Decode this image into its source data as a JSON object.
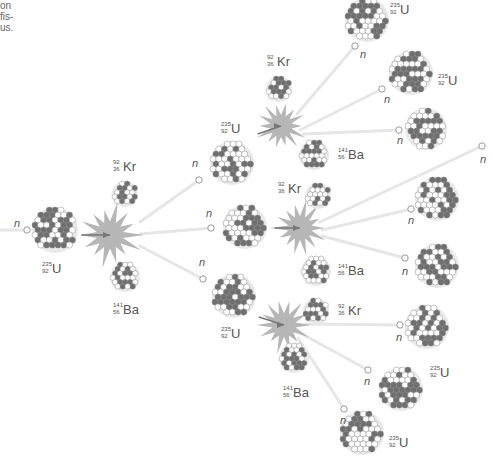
{
  "caption": {
    "lines": [
      "on",
      "fis-",
      "us."
    ]
  },
  "colors": {
    "nucleon_dark": "#6f6f6f",
    "nucleon_light": "#ffffff",
    "nucleon_stroke": "#8a8a8a",
    "burst": "#a9a9a9",
    "trail": "#e6e6e6",
    "neutron_stroke": "#9a9a9a",
    "text": "#555555"
  },
  "labels": {
    "neutron": "n",
    "uranium": {
      "symbol": "U",
      "mass": "235",
      "atomic": "92"
    },
    "krypton": {
      "symbol": "Kr",
      "mass": "92",
      "atomic": "36"
    },
    "barium": {
      "symbol": "Ba",
      "mass": "141",
      "atomic": "56"
    }
  },
  "nuclei": [
    {
      "id": "u-gen0",
      "type": "uranium",
      "cx": 55,
      "cy": 230,
      "r": 23,
      "label_x": 42,
      "label_y": 262
    },
    {
      "id": "kr-gen1",
      "type": "krypton",
      "cx": 125,
      "cy": 194,
      "r": 13,
      "label_x": 113,
      "label_y": 160
    },
    {
      "id": "ba-gen1",
      "type": "barium",
      "cx": 125,
      "cy": 277,
      "r": 15,
      "label_x": 113,
      "label_y": 303
    },
    {
      "id": "u-gen1-top",
      "type": "uranium",
      "cx": 232,
      "cy": 163,
      "r": 22,
      "label_x": 221,
      "label_y": 122
    },
    {
      "id": "u-gen1-mid",
      "type": "uranium",
      "cx": 245,
      "cy": 227,
      "r": 22,
      "label_x": 0,
      "label_y": 0,
      "hide_label": true
    },
    {
      "id": "u-gen1-bot",
      "type": "uranium",
      "cx": 234,
      "cy": 296,
      "r": 22,
      "label_x": 221,
      "label_y": 327
    },
    {
      "id": "kr-gen2a",
      "type": "krypton",
      "cx": 279,
      "cy": 89,
      "r": 13,
      "label_x": 267,
      "label_y": 55
    },
    {
      "id": "ba-gen2a",
      "type": "barium",
      "cx": 314,
      "cy": 155,
      "r": 15,
      "label_x": 338,
      "label_y": 148
    },
    {
      "id": "kr-gen2b",
      "type": "krypton",
      "cx": 318,
      "cy": 196,
      "r": 13,
      "label_x": 278,
      "label_y": 182
    },
    {
      "id": "ba-gen2b",
      "type": "barium",
      "cx": 316,
      "cy": 271,
      "r": 15,
      "label_x": 338,
      "label_y": 264
    },
    {
      "id": "kr-gen2c",
      "type": "krypton",
      "cx": 316,
      "cy": 311,
      "r": 13,
      "label_x": 338,
      "label_y": 304
    },
    {
      "id": "ba-gen2c",
      "type": "barium",
      "cx": 294,
      "cy": 358,
      "r": 15,
      "label_x": 283,
      "label_y": 386
    },
    {
      "id": "u-gen2-1",
      "type": "uranium",
      "cx": 367,
      "cy": 20,
      "r": 22,
      "label_x": 390,
      "label_y": 3
    },
    {
      "id": "u-gen2-2",
      "type": "uranium",
      "cx": 411,
      "cy": 73,
      "r": 22,
      "label_x": 438,
      "label_y": 74
    },
    {
      "id": "u-gen2-3",
      "type": "uranium",
      "cx": 426,
      "cy": 129,
      "r": 21,
      "label_x": 0,
      "label_y": 0,
      "hide_label": true
    },
    {
      "id": "u-gen2-4",
      "type": "uranium",
      "cx": 437,
      "cy": 199,
      "r": 22,
      "label_x": 0,
      "label_y": 0,
      "hide_label": true
    },
    {
      "id": "u-gen2-5",
      "type": "uranium",
      "cx": 437,
      "cy": 266,
      "r": 22,
      "label_x": 0,
      "label_y": 0,
      "hide_label": true
    },
    {
      "id": "u-gen2-6",
      "type": "uranium",
      "cx": 427,
      "cy": 327,
      "r": 22,
      "label_x": 0,
      "label_y": 0,
      "hide_label": true
    },
    {
      "id": "u-gen2-7",
      "type": "uranium",
      "cx": 401,
      "cy": 389,
      "r": 22,
      "label_x": 430,
      "label_y": 366
    },
    {
      "id": "u-gen2-8",
      "type": "uranium",
      "cx": 362,
      "cy": 433,
      "r": 22,
      "label_x": 389,
      "label_y": 436
    }
  ],
  "bursts": [
    {
      "id": "burst-gen1",
      "cx": 110,
      "cy": 235,
      "r": 32
    },
    {
      "id": "burst-gen2-top",
      "cx": 281,
      "cy": 126,
      "r": 26
    },
    {
      "id": "burst-gen2-mid",
      "cx": 300,
      "cy": 228,
      "r": 28
    },
    {
      "id": "burst-gen2-bot",
      "cx": 284,
      "cy": 325,
      "r": 28
    }
  ],
  "neutrons": [
    {
      "id": "n-0",
      "cx": 27,
      "cy": 230,
      "lx": 14,
      "ly": 217,
      "from_x": 0,
      "from_y": 230
    },
    {
      "id": "n-1a",
      "cx": 199,
      "cy": 180,
      "lx": 192,
      "ly": 157,
      "from_x": 140,
      "from_y": 222
    },
    {
      "id": "n-1b",
      "cx": 211,
      "cy": 228,
      "lx": 206,
      "ly": 207,
      "from_x": 140,
      "from_y": 234
    },
    {
      "id": "n-1c",
      "cx": 203,
      "cy": 279,
      "lx": 199,
      "ly": 256,
      "from_x": 140,
      "from_y": 246
    },
    {
      "id": "n-2a",
      "cx": 355,
      "cy": 46,
      "lx": 360,
      "ly": 48,
      "from_x": 297,
      "from_y": 114
    },
    {
      "id": "n-2b",
      "cx": 382,
      "cy": 89,
      "lx": 384,
      "ly": 93,
      "from_x": 300,
      "from_y": 130
    },
    {
      "id": "n-2c",
      "cx": 399,
      "cy": 130,
      "lx": 397,
      "ly": 134,
      "from_x": 303,
      "from_y": 134
    },
    {
      "id": "n-2d",
      "cx": 482,
      "cy": 146,
      "lx": 480,
      "ly": 153,
      "from_x": 320,
      "from_y": 222
    },
    {
      "id": "n-2e",
      "cx": 411,
      "cy": 209,
      "lx": 408,
      "ly": 214,
      "from_x": 322,
      "from_y": 230
    },
    {
      "id": "n-2f",
      "cx": 405,
      "cy": 258,
      "lx": 402,
      "ly": 265,
      "from_x": 322,
      "from_y": 236
    },
    {
      "id": "n-2g",
      "cx": 400,
      "cy": 325,
      "lx": 396,
      "ly": 331,
      "from_x": 306,
      "from_y": 324
    },
    {
      "id": "n-2h",
      "cx": 368,
      "cy": 370,
      "lx": 364,
      "ly": 375,
      "from_x": 302,
      "from_y": 334
    },
    {
      "id": "n-2i",
      "cx": 344,
      "cy": 409,
      "lx": 340,
      "ly": 414,
      "from_x": 298,
      "from_y": 338
    }
  ]
}
